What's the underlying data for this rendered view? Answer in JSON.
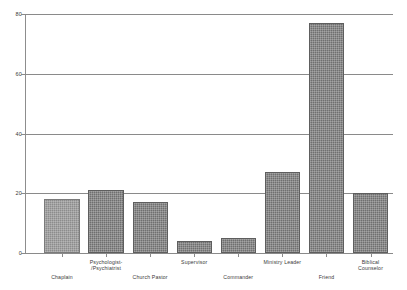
{
  "chart_data": {
    "type": "bar",
    "title": "",
    "subtitle": "",
    "xlabel": "",
    "ylabel": "",
    "ylim": [
      0,
      80
    ],
    "yticks": [
      0,
      20,
      40,
      60,
      80
    ],
    "grid": true,
    "legend": false,
    "legend_position": "none",
    "categories": [
      "Chaplain",
      "Psychologist-\n/Psychiatrist",
      "Church Pastor",
      "Supervisor",
      "Commander",
      "Ministry Leader",
      "Friend",
      "Biblical Counselor"
    ],
    "values": [
      18,
      21,
      17,
      4,
      5,
      27,
      77,
      20
    ],
    "bar_colors": [
      "#8c8c8c",
      "#6f6f6f",
      "#6f6f6f",
      "#6f6f6f",
      "#6f6f6f",
      "#6f6f6f",
      "#6f6f6f",
      "#6f6f6f"
    ],
    "axis_color": "#8a8a8a",
    "gridline_color": "#8a8a8a",
    "background": "#ffffff"
  },
  "axis": {
    "y_tick_labels": [
      "0",
      "20",
      "40",
      "60",
      "80"
    ]
  },
  "labels": {
    "cat0": "Chaplain",
    "cat1": "Psychologist-\n/Psychiatrist",
    "cat2": "Church Pastor",
    "cat3": "Supervisor",
    "cat4": "Commander",
    "cat5": "Ministry Leader",
    "cat6": "Friend",
    "cat7": "Biblical Counselor"
  }
}
